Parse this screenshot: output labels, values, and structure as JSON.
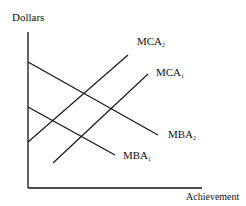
{
  "diagram": {
    "y_axis_label": "Dollars",
    "x_axis_label": "Achievement",
    "curves": [
      {
        "name": "MCA",
        "sub": "2",
        "kind": "marginal cost, upward sloping"
      },
      {
        "name": "MCA",
        "sub": "1",
        "kind": "marginal cost, upward sloping"
      },
      {
        "name": "MBA",
        "sub": "2",
        "kind": "marginal benefit, downward sloping"
      },
      {
        "name": "MBA",
        "sub": "1",
        "kind": "marginal benefit, downward sloping"
      }
    ],
    "line_color": "#111111",
    "background": "#ffffff"
  }
}
